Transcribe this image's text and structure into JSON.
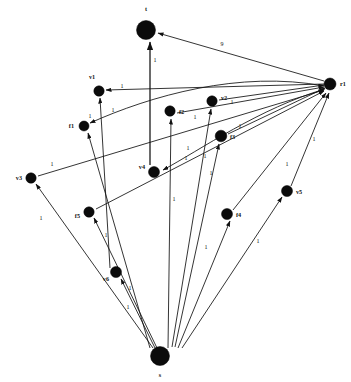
{
  "figure": {
    "title": "",
    "caption": ""
  },
  "nodes": [
    {
      "id": "t",
      "label": "t",
      "x": 146,
      "y": 30,
      "r": 9.5,
      "lx": 146,
      "ly": 11,
      "anchor": "middle"
    },
    {
      "id": "r1",
      "label": "r1",
      "x": 330,
      "y": 84,
      "r": 6.0,
      "lx": 340,
      "ly": 86,
      "anchor": "start"
    },
    {
      "id": "v1",
      "label": "v1",
      "x": 99,
      "y": 91,
      "r": 5.2,
      "lx": 92,
      "ly": 79,
      "anchor": "middle"
    },
    {
      "id": "f1",
      "label": "f1",
      "x": 84,
      "y": 126,
      "r": 5.0,
      "lx": 74,
      "ly": 128,
      "anchor": "end"
    },
    {
      "id": "f2",
      "label": "f2",
      "x": 170,
      "y": 111,
      "r": 5.2,
      "lx": 179,
      "ly": 114,
      "anchor": "start"
    },
    {
      "id": "v2",
      "label": "v2",
      "x": 212,
      "y": 101,
      "r": 5.2,
      "lx": 221,
      "ly": 100,
      "anchor": "start"
    },
    {
      "id": "f3",
      "label": "f3",
      "x": 221,
      "y": 136,
      "r": 5.8,
      "lx": 230,
      "ly": 139,
      "anchor": "start"
    },
    {
      "id": "v4",
      "label": "v4",
      "x": 154,
      "y": 172,
      "r": 5.5,
      "lx": 145,
      "ly": 169,
      "anchor": "end"
    },
    {
      "id": "v3",
      "label": "v3",
      "x": 31,
      "y": 178,
      "r": 5.2,
      "lx": 22,
      "ly": 180,
      "anchor": "end"
    },
    {
      "id": "f5",
      "label": "f5",
      "x": 89,
      "y": 212,
      "r": 5.2,
      "lx": 80,
      "ly": 218,
      "anchor": "end"
    },
    {
      "id": "f4",
      "label": "f4",
      "x": 227,
      "y": 214,
      "r": 5.5,
      "lx": 236,
      "ly": 217,
      "anchor": "start"
    },
    {
      "id": "v5",
      "label": "v5",
      "x": 287,
      "y": 191,
      "r": 5.5,
      "lx": 296,
      "ly": 194,
      "anchor": "start"
    },
    {
      "id": "v6",
      "label": "v6",
      "x": 116,
      "y": 272,
      "r": 5.5,
      "lx": 109,
      "ly": 281,
      "anchor": "end"
    },
    {
      "id": "s",
      "label": "s",
      "x": 160,
      "y": 356,
      "r": 9.5,
      "lx": 160,
      "ly": 377,
      "anchor": "middle"
    }
  ],
  "edges": [
    {
      "from": "t",
      "to": "t",
      "label": "1",
      "lx": 155,
      "ly": 62,
      "d": "M 150 165 L 150 42",
      "arrow": true,
      "thick": true
    },
    {
      "from": "r1",
      "to": "t",
      "label": "9",
      "lx": 222,
      "ly": 46,
      "d": "M 324 81 L 158 33",
      "arrow": true,
      "thick": false
    },
    {
      "from": "r1",
      "to": "v1",
      "label": "1",
      "lx": 122,
      "ly": 88,
      "d": "M 324 84 L 106 90",
      "arrow": true,
      "thick": false
    },
    {
      "from": "r1",
      "to": "f1",
      "label": "1",
      "lx": 90,
      "ly": 118,
      "d": "M 324 86 C 240 70 150 96 90 123",
      "arrow": true,
      "thick": false
    },
    {
      "from": "r1",
      "to": "v4",
      "label": "1",
      "lx": 186,
      "ly": 160,
      "d": "M 325 89 C 260 108 200 150 163 170",
      "arrow": true,
      "thick": false
    },
    {
      "from": "v2",
      "to": "r1",
      "label": "1",
      "lx": 232,
      "ly": 104,
      "d": "M 219 100 L 324 85",
      "arrow": true,
      "thick": false
    },
    {
      "from": "f2",
      "to": "r1",
      "label": "1",
      "lx": 195,
      "ly": 119,
      "d": "M 177 113 L 324 87",
      "arrow": true,
      "thick": false
    },
    {
      "from": "f3",
      "to": "r1",
      "label": "1",
      "lx": 240,
      "ly": 128,
      "d": "M 228 134 L 325 88",
      "arrow": true,
      "thick": false
    },
    {
      "from": "v3",
      "to": "r1",
      "label": "1",
      "lx": 52,
      "ly": 166,
      "d": "M 38 176 L 324 90",
      "arrow": true,
      "thick": false
    },
    {
      "from": "f5",
      "to": "r1",
      "label": "1",
      "lx": 188,
      "ly": 150,
      "d": "M 96 209 L 324 91",
      "arrow": true,
      "thick": false
    },
    {
      "from": "f4",
      "to": "r1",
      "label": "1",
      "lx": 287,
      "ly": 166,
      "d": "M 233 210 L 326 93",
      "arrow": true,
      "thick": false
    },
    {
      "from": "v5",
      "to": "r1",
      "label": "1",
      "lx": 314,
      "ly": 141,
      "d": "M 291 186 L 329 93",
      "arrow": true,
      "thick": false
    },
    {
      "from": "f1",
      "to": "v1",
      "label": "1",
      "lx": 113,
      "ly": 112,
      "d": "M 110 268 L 100 98",
      "arrow": true,
      "thick": false
    },
    {
      "from": "s",
      "to": "f2",
      "label": "1",
      "lx": 174,
      "ly": 201,
      "d": "M 168 348 L 171 119",
      "arrow": true,
      "thick": false
    },
    {
      "from": "s",
      "to": "v2",
      "label": "1",
      "lx": 205,
      "ly": 158,
      "d": "M 172 347 L 211 109",
      "arrow": true,
      "thick": false
    },
    {
      "from": "s",
      "to": "f3",
      "label": "1",
      "lx": 211,
      "ly": 175,
      "d": "M 175 347 L 219 144",
      "arrow": true,
      "thick": false
    },
    {
      "from": "s",
      "to": "v3",
      "label": "1",
      "lx": 41,
      "ly": 220,
      "d": "M 153 348 L 36 184",
      "arrow": true,
      "thick": false
    },
    {
      "from": "s",
      "to": "f5",
      "label": "1",
      "lx": 106,
      "ly": 237,
      "d": "M 157 348 L 94 218",
      "arrow": true,
      "thick": false
    },
    {
      "from": "s",
      "to": "v6",
      "label": "1",
      "lx": 128,
      "ly": 309,
      "d": "M 155 348 L 121 279",
      "arrow": true,
      "thick": false
    },
    {
      "from": "s",
      "to": "f4",
      "label": "1",
      "lx": 206,
      "ly": 249,
      "d": "M 178 348 L 230 221",
      "arrow": true,
      "thick": false
    },
    {
      "from": "s",
      "to": "v5",
      "label": "1",
      "lx": 258,
      "ly": 243,
      "d": "M 182 348 L 282 197",
      "arrow": true,
      "thick": false
    },
    {
      "from": "s",
      "to": "f1",
      "label": "1",
      "lx": 130,
      "ly": 290,
      "d": "M 150 348 L 88 133",
      "arrow": true,
      "thick": false
    }
  ],
  "colors": {
    "node_fill": "#0b0b0b",
    "edge_stroke": "#111111",
    "background": "#ffffff"
  }
}
